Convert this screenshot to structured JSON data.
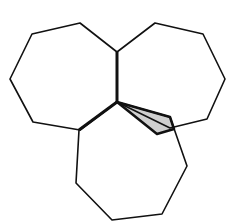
{
  "figure": {
    "stroke_color": "#111111",
    "shade_color": "#cfcfcf",
    "background": "#ffffff"
  },
  "shapes": {
    "left_heptagon": "32,34 80,23 117,52 117,102 80,130 33,122 10,79",
    "right_heptagon": "117,52 155,23 203,34 225,79 207,119 170,128 117,102",
    "bottom_heptagon": "117,102 170,117 187,166 162,214 112,220 76,183 79,130",
    "shaded_region": "117,102 170,117 174,129 157,134",
    "shared_edge_top": "117,52 117,102",
    "shared_edge_left": "117,102 79,130"
  }
}
